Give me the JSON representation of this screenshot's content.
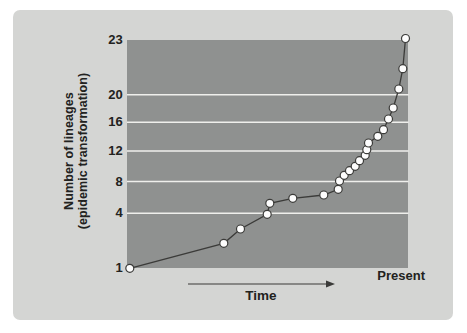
{
  "colors": {
    "page_bg": "#ffffff",
    "panel_bg": "#d4d5d3",
    "plot_bg": "#8f9190",
    "gridline": "#efefec",
    "line": "#3b3b39",
    "marker_fill": "#fdfdfd",
    "marker_stroke": "#3b3b39",
    "text": "#222220"
  },
  "figure": {
    "y_axis_title_line1": "Number of lineages",
    "y_axis_title_line2": "(epidemic transformation)",
    "x_axis_label": "Time",
    "x_axis_end_label": "Present"
  },
  "chart_data": {
    "type": "line",
    "title": "",
    "xlabel": "Time",
    "ylabel": "Number of lineages (epidemic transformation)",
    "x_end_label": "Present",
    "y_tick_labels": [
      23,
      20,
      16,
      12,
      8,
      4,
      1
    ],
    "gridline_values": [
      20,
      16,
      12,
      8,
      4
    ],
    "legend": "none",
    "plot_size": {
      "width": 281.5,
      "height": 228
    },
    "y_ticks": [
      {
        "label": "23",
        "py": 0
      },
      {
        "label": "20",
        "py": 54.7
      },
      {
        "label": "16",
        "py": 82.3
      },
      {
        "label": "12",
        "py": 111
      },
      {
        "label": "8",
        "py": 141.5
      },
      {
        "label": "4",
        "py": 173.3
      },
      {
        "label": "1",
        "py": 228
      }
    ],
    "gridlines": [
      {
        "value": 20,
        "py": 54.7
      },
      {
        "value": 16,
        "py": 82.3
      },
      {
        "value": 12,
        "py": 111
      },
      {
        "value": 8,
        "py": 141.5
      },
      {
        "value": 4,
        "py": 173.3
      }
    ],
    "series": [
      {
        "name": "lineages-through-time",
        "points": [
          {
            "n": 1,
            "px": 2.8,
            "py": 228.3
          },
          {
            "n": 2,
            "px": 96.8,
            "py": 203.3
          },
          {
            "n": 3,
            "px": 113.5,
            "py": 189.0
          },
          {
            "n": 4,
            "px": 140.2,
            "py": 174.3
          },
          {
            "n": 5,
            "px": 142.8,
            "py": 163.3
          },
          {
            "n": 6,
            "px": 165.8,
            "py": 158.3
          },
          {
            "n": 7,
            "px": 196.8,
            "py": 155.0
          },
          {
            "n": 8,
            "px": 211.2,
            "py": 149.3
          },
          {
            "n": 9,
            "px": 212.5,
            "py": 141.0
          },
          {
            "n": 10,
            "px": 217.2,
            "py": 135.3
          },
          {
            "n": 11,
            "px": 222.5,
            "py": 130.7
          },
          {
            "n": 12,
            "px": 228.2,
            "py": 126.3
          },
          {
            "n": 13,
            "px": 232.5,
            "py": 120.7
          },
          {
            "n": 14,
            "px": 238.2,
            "py": 115.3
          },
          {
            "n": 15,
            "px": 239.8,
            "py": 109.7
          },
          {
            "n": 16,
            "px": 241.5,
            "py": 103.0
          },
          {
            "n": 17,
            "px": 250.8,
            "py": 96.3
          },
          {
            "n": 18,
            "px": 256.5,
            "py": 89.7
          },
          {
            "n": 19,
            "px": 261.5,
            "py": 79.0
          },
          {
            "n": 20,
            "px": 266.2,
            "py": 68.0
          },
          {
            "n": 21,
            "px": 271.8,
            "py": 49.0
          },
          {
            "n": 22,
            "px": 275.8,
            "py": 28.7
          },
          {
            "n": 23,
            "px": 278.5,
            "py": -1.5
          }
        ]
      }
    ]
  }
}
